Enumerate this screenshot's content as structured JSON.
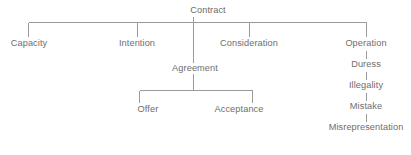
{
  "diagram": {
    "type": "tree",
    "title": "Contract",
    "background_color": "#ffffff",
    "line_color": "#9a9a9a",
    "text_color": "#6e6e6e",
    "nodes": {
      "root": {
        "label": "Contract"
      },
      "capacity": {
        "label": "Capacity"
      },
      "intention": {
        "label": "Intention"
      },
      "agreement": {
        "label": "Agreement"
      },
      "consideration": {
        "label": "Consideration"
      },
      "operation": {
        "label": "Operation"
      },
      "offer": {
        "label": "Offer"
      },
      "acceptance": {
        "label": "Acceptance"
      },
      "duress": {
        "label": "Duress"
      },
      "illegality": {
        "label": "Illegality"
      },
      "mistake": {
        "label": "Mistake"
      },
      "misrepresentation": {
        "label": "Misrepresentation"
      }
    }
  }
}
